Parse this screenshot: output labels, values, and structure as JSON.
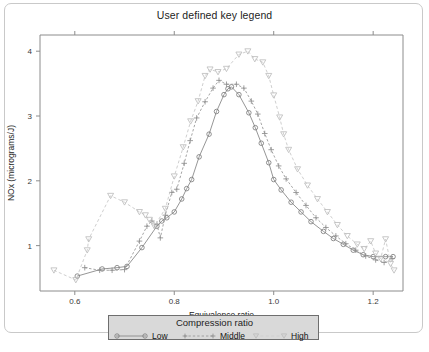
{
  "figure": {
    "title": "User defined key legend",
    "background_color": "#ffffff",
    "border_color": "#c9c9c9"
  },
  "legend": {
    "title": "Compression ratio",
    "box_fill": "#d9d9d9",
    "box_border": "#6e6e6e",
    "entries": [
      {
        "label": "Low",
        "marker": "circle-icon",
        "line_style": "solid",
        "color": "#8a8a8a"
      },
      {
        "label": "Middle",
        "marker": "plus-icon",
        "line_style": "dotted",
        "color": "#9a9a9a"
      },
      {
        "label": "High",
        "marker": "triangle-down-icon",
        "line_style": "dashed",
        "color": "#cfcfcf"
      }
    ]
  },
  "chart_data": {
    "type": "line",
    "title": "User defined key legend",
    "xlabel": "Equivalence ratio",
    "ylabel": "NOx (micrograms/J)",
    "xlim": [
      0.53,
      1.26
    ],
    "ylim": [
      0.3,
      4.25
    ],
    "xticks": [
      0.6,
      0.8,
      1.0,
      1.2
    ],
    "xtick_labels": [
      "0.6",
      "0.8",
      "1.0",
      "1.2"
    ],
    "yticks": [
      1,
      2,
      3,
      4
    ],
    "ytick_labels": [
      "1",
      "2",
      "3",
      "4"
    ],
    "grid": false,
    "legend_position": "below-axes",
    "series": [
      {
        "name": "Low",
        "marker": "circle",
        "line_style": "solid",
        "color": "#8a8a8a",
        "points": [
          [
            0.605,
            0.53
          ],
          [
            0.655,
            0.64
          ],
          [
            0.685,
            0.66
          ],
          [
            0.705,
            0.68
          ],
          [
            0.735,
            0.97
          ],
          [
            0.765,
            1.3
          ],
          [
            0.775,
            1.38
          ],
          [
            0.785,
            1.43
          ],
          [
            0.8,
            1.52
          ],
          [
            0.815,
            1.72
          ],
          [
            0.825,
            1.88
          ],
          [
            0.835,
            2.02
          ],
          [
            0.85,
            2.37
          ],
          [
            0.87,
            2.72
          ],
          [
            0.885,
            3.07
          ],
          [
            0.9,
            3.33
          ],
          [
            0.908,
            3.42
          ],
          [
            0.915,
            3.45
          ],
          [
            0.93,
            3.33
          ],
          [
            0.95,
            3.05
          ],
          [
            0.963,
            2.82
          ],
          [
            0.975,
            2.58
          ],
          [
            0.99,
            2.28
          ],
          [
            1.0,
            2.02
          ],
          [
            1.015,
            1.86
          ],
          [
            1.035,
            1.67
          ],
          [
            1.055,
            1.52
          ],
          [
            1.075,
            1.37
          ],
          [
            1.1,
            1.22
          ],
          [
            1.12,
            1.11
          ],
          [
            1.14,
            1.02
          ],
          [
            1.16,
            0.93
          ],
          [
            1.18,
            0.86
          ],
          [
            1.2,
            0.83
          ],
          [
            1.225,
            0.83
          ],
          [
            1.24,
            0.83
          ]
        ]
      },
      {
        "name": "Middle",
        "marker": "plus",
        "line_style": "dotted",
        "color": "#9a9a9a",
        "points": [
          [
            0.62,
            0.66
          ],
          [
            0.65,
            0.62
          ],
          [
            0.675,
            0.62
          ],
          [
            0.7,
            0.63
          ],
          [
            0.73,
            1.07
          ],
          [
            0.745,
            1.3
          ],
          [
            0.755,
            1.38
          ],
          [
            0.765,
            1.33
          ],
          [
            0.772,
            1.12
          ],
          [
            0.782,
            1.47
          ],
          [
            0.795,
            1.82
          ],
          [
            0.805,
            1.87
          ],
          [
            0.82,
            2.27
          ],
          [
            0.832,
            2.62
          ],
          [
            0.845,
            2.97
          ],
          [
            0.862,
            3.22
          ],
          [
            0.878,
            3.43
          ],
          [
            0.89,
            3.55
          ],
          [
            0.905,
            3.49
          ],
          [
            0.925,
            3.49
          ],
          [
            0.94,
            3.43
          ],
          [
            0.955,
            3.23
          ],
          [
            0.968,
            3.03
          ],
          [
            0.982,
            2.73
          ],
          [
            0.995,
            2.48
          ],
          [
            1.01,
            2.23
          ],
          [
            1.025,
            2.03
          ],
          [
            1.045,
            1.82
          ],
          [
            1.065,
            1.62
          ],
          [
            1.085,
            1.43
          ],
          [
            1.105,
            1.28
          ],
          [
            1.125,
            1.15
          ],
          [
            1.145,
            1.03
          ],
          [
            1.165,
            0.93
          ],
          [
            1.185,
            0.84
          ],
          [
            1.205,
            0.78
          ],
          [
            1.222,
            0.74
          ],
          [
            1.238,
            0.8
          ]
        ]
      },
      {
        "name": "High",
        "marker": "triangle-down",
        "line_style": "dashed",
        "color": "#cfcfcf",
        "points": [
          [
            0.558,
            0.62
          ],
          [
            0.602,
            0.47
          ],
          [
            0.625,
            0.93
          ],
          [
            0.628,
            1.1
          ],
          [
            0.672,
            1.77
          ],
          [
            0.7,
            1.67
          ],
          [
            0.73,
            1.52
          ],
          [
            0.742,
            1.47
          ],
          [
            0.75,
            1.4
          ],
          [
            0.76,
            1.3
          ],
          [
            0.782,
            1.57
          ],
          [
            0.8,
            2.07
          ],
          [
            0.818,
            2.52
          ],
          [
            0.833,
            2.92
          ],
          [
            0.848,
            3.23
          ],
          [
            0.862,
            3.62
          ],
          [
            0.872,
            3.72
          ],
          [
            0.888,
            3.68
          ],
          [
            0.905,
            3.73
          ],
          [
            0.93,
            3.95
          ],
          [
            0.948,
            4.0
          ],
          [
            0.962,
            3.88
          ],
          [
            0.978,
            3.83
          ],
          [
            0.99,
            3.62
          ],
          [
            1.0,
            3.32
          ],
          [
            1.012,
            2.98
          ],
          [
            1.02,
            2.72
          ],
          [
            1.03,
            2.48
          ],
          [
            1.048,
            2.18
          ],
          [
            1.068,
            1.93
          ],
          [
            1.088,
            1.72
          ],
          [
            1.108,
            1.52
          ],
          [
            1.128,
            1.32
          ],
          [
            1.148,
            1.15
          ],
          [
            1.168,
            1.02
          ],
          [
            1.182,
            0.95
          ],
          [
            1.195,
            1.07
          ],
          [
            1.205,
            0.88
          ],
          [
            1.215,
            0.8
          ],
          [
            1.225,
            1.1
          ],
          [
            1.235,
            0.72
          ],
          [
            1.242,
            0.62
          ]
        ]
      }
    ]
  }
}
